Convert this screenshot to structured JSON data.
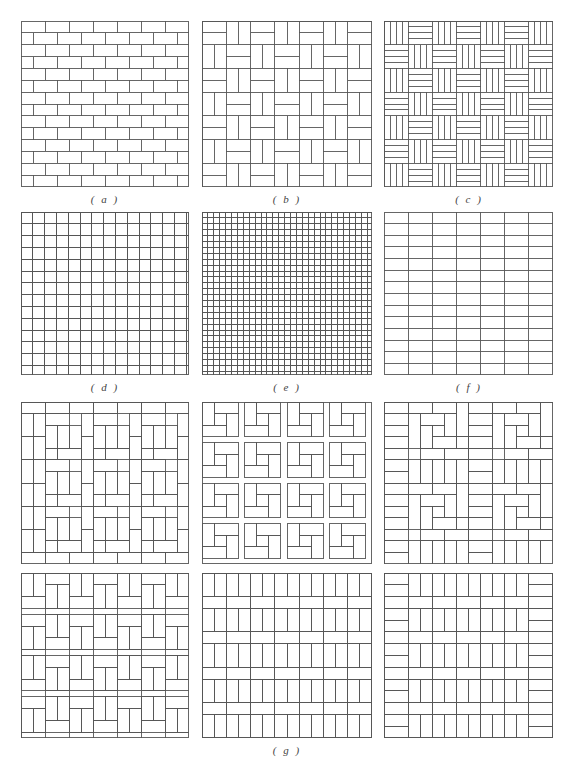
{
  "figure": {
    "panels": [
      {
        "id": "a",
        "label": "( a )",
        "pattern": "running-bond",
        "x": 21,
        "y": 21,
        "w": 168,
        "h": 166,
        "cols": 7,
        "rows": 14
      },
      {
        "id": "b",
        "label": "( b )",
        "pattern": "basket-weave-pairs",
        "x": 202,
        "y": 21,
        "w": 170,
        "h": 166,
        "cols": 7,
        "rows": 7
      },
      {
        "id": "c",
        "label": "( c )",
        "pattern": "parquet-checker-4strip",
        "x": 384,
        "y": 21,
        "w": 169,
        "h": 166,
        "cols": 7,
        "rows": 7
      },
      {
        "id": "d",
        "label": "( d )",
        "pattern": "herringbone",
        "x": 21,
        "y": 212,
        "w": 168,
        "h": 163
      },
      {
        "id": "e",
        "label": "( e )",
        "pattern": "double-herringbone",
        "x": 202,
        "y": 212,
        "w": 170,
        "h": 163
      },
      {
        "id": "f",
        "label": "( f )",
        "pattern": "stack-bond",
        "x": 384,
        "y": 212,
        "w": 169,
        "h": 163,
        "cols": 7,
        "rows": 14
      },
      {
        "id": "g1",
        "pattern": "pinwheel",
        "x": 21,
        "y": 402,
        "w": 168,
        "h": 162
      },
      {
        "id": "g2",
        "pattern": "pinwheel-variant",
        "x": 202,
        "y": 402,
        "w": 170,
        "h": 162
      },
      {
        "id": "g3",
        "pattern": "spiral-block",
        "x": 384,
        "y": 402,
        "w": 169,
        "h": 162
      },
      {
        "id": "g4",
        "pattern": "basket-tee",
        "x": 21,
        "y": 573,
        "w": 168,
        "h": 165
      },
      {
        "id": "g5",
        "pattern": "soldier-band",
        "x": 202,
        "y": 573,
        "w": 170,
        "h": 165
      },
      {
        "id": "g6",
        "pattern": "soldier-band-bordered",
        "x": 384,
        "y": 573,
        "w": 169,
        "h": 165
      }
    ],
    "labels": {
      "a": "( a )",
      "b": "( b )",
      "c": "( c )",
      "d": "( d )",
      "e": "( e )",
      "f": "( f )",
      "g": "( g )"
    },
    "colors": {
      "line": "#555555",
      "background": "#ffffff"
    }
  }
}
